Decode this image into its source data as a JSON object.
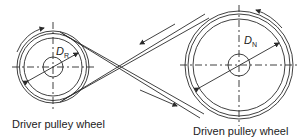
{
  "diagram": {
    "type": "crossed-belt-drive",
    "driver": {
      "label": "Driver pulley wheel",
      "diameter_symbol": "D",
      "diameter_subscript": "R",
      "rotation": "clockwise"
    },
    "driven": {
      "label": "Driven pulley wheel",
      "diameter_symbol": "D",
      "diameter_subscript": "N",
      "rotation": "counter-clockwise"
    },
    "belt": {
      "arrangement": "crossed",
      "upper_arrow_direction": "toward driver",
      "lower_arrow_direction": "toward driven"
    },
    "colors": {
      "line": "#2a2a2a",
      "background": "#ffffff"
    }
  }
}
